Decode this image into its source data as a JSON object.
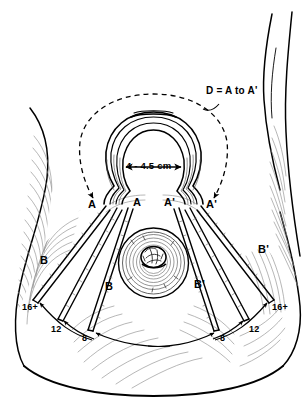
{
  "figure": {
    "background_color": "#ffffff",
    "ink_color": "#000000",
    "shading_color": "#8a8a8a"
  },
  "annotations": {
    "formula": "D = A to A'",
    "areola_diameter": "4 - 4.5 cm"
  },
  "labels": {
    "left": {
      "keyhole_outer": "A",
      "keyhole_inner": "A",
      "limb_outer": "B",
      "limb_inner": "B",
      "mark_outer": "16+",
      "mark_middle": "12",
      "mark_inner": "8"
    },
    "right": {
      "keyhole_outer": "A'",
      "keyhole_inner": "A'",
      "limb_outer": "B'",
      "limb_inner": "B'",
      "mark_outer": "16+",
      "mark_middle": "12",
      "mark_inner": "8"
    }
  },
  "icons": {
    "arrowhead": "arrowhead-icon",
    "dimension_arrow": "dimension-arrow-icon",
    "dashed_arc": "dashed-arc-icon"
  }
}
